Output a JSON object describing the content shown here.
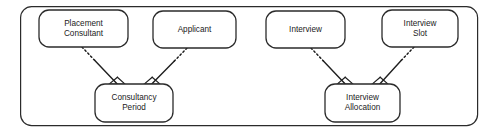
{
  "diagram": {
    "type": "entity-relationship-diagram",
    "container": {
      "name": "outer-group-frame",
      "shape": "rounded-rectangle",
      "x": 20,
      "y": 6,
      "width": 458,
      "height": 120,
      "rx": 11
    },
    "style": {
      "stroke_color": "#2b2b2b",
      "fill_color": "#ffffff",
      "background_color": "#ffffff",
      "entity_stroke_width": 1.3,
      "container_stroke_width": 1.2,
      "connector_stroke_width": 1.3
    },
    "entities": [
      {
        "id": "placement-consultant",
        "lines": [
          "Placement",
          "Consultant"
        ],
        "x": 39,
        "y": 10,
        "width": 89,
        "height": 37,
        "rx": 10
      },
      {
        "id": "applicant",
        "lines": [
          "Applicant"
        ],
        "x": 153,
        "y": 11,
        "width": 83,
        "height": 37,
        "rx": 10
      },
      {
        "id": "consultancy-period",
        "lines": [
          "Consultancy",
          "Period"
        ],
        "x": 95,
        "y": 84,
        "width": 78,
        "height": 38,
        "rx": 10
      },
      {
        "id": "interview",
        "lines": [
          "Interview"
        ],
        "x": 266,
        "y": 11,
        "width": 79,
        "height": 37,
        "rx": 10
      },
      {
        "id": "interview-slot",
        "lines": [
          "Interview",
          "Slot"
        ],
        "x": 382,
        "y": 10,
        "width": 76,
        "height": 37,
        "rx": 10
      },
      {
        "id": "interview-allocation",
        "lines": [
          "Interview",
          "Allocation"
        ],
        "x": 325,
        "y": 84,
        "width": 75,
        "height": 38,
        "rx": 10
      }
    ],
    "connectors": [
      {
        "id": "placement-consultant-to-consultancy-period",
        "from": "placement-consultant",
        "to": "consultancy-period",
        "x1": 82,
        "y1": 47,
        "x2": 117,
        "y2": 84,
        "dashed_portion": 0.36,
        "arrowhead": "crows-foot"
      },
      {
        "id": "applicant-to-consultancy-period",
        "from": "applicant",
        "to": "consultancy-period",
        "x1": 187,
        "y1": 48,
        "x2": 152,
        "y2": 84,
        "dashed_portion": 0.36,
        "arrowhead": "crows-foot"
      },
      {
        "id": "interview-to-interview-allocation",
        "from": "interview",
        "to": "interview-allocation",
        "x1": 311,
        "y1": 48,
        "x2": 345,
        "y2": 84,
        "dashed_portion": 0.36,
        "arrowhead": "crows-foot"
      },
      {
        "id": "interview-slot-to-interview-allocation",
        "from": "interview-slot",
        "to": "interview-allocation",
        "x1": 414,
        "y1": 47,
        "x2": 380,
        "y2": 84,
        "dashed_portion": 0.36,
        "arrowhead": "crows-foot"
      }
    ]
  }
}
